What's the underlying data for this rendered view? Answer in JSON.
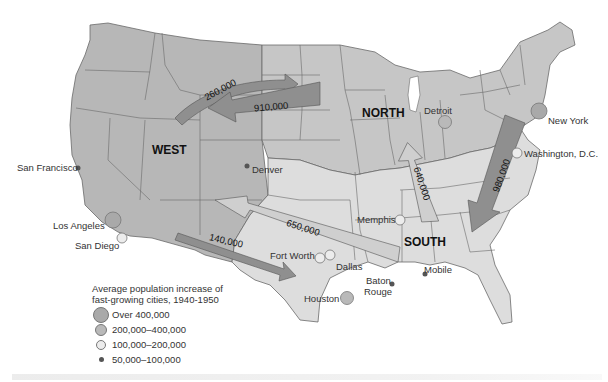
{
  "map": {
    "title": "Average population increase of fast-growing cities, 1940-1950",
    "colors": {
      "west": "#b7b7b7",
      "north": "#c6c6c6",
      "south": "#dddddd",
      "border": "#6a6a6a",
      "arrow_dark": "#8f8f8f",
      "arrow_light": "#cfcfcf",
      "circle_large": "#a9a9a9",
      "circle_medium": "#b9b9b9",
      "circle_small": "#ececec",
      "dot": "#555555"
    },
    "regions": [
      {
        "name": "WEST"
      },
      {
        "name": "NORTH"
      },
      {
        "name": "SOUTH"
      }
    ],
    "migration_arrows": [
      {
        "label": "260,000",
        "from": "WEST",
        "to": "NORTH"
      },
      {
        "label": "910,000",
        "from": "NORTH",
        "to": "WEST"
      },
      {
        "label": "140,000",
        "from": "WEST",
        "to": "SOUTH"
      },
      {
        "label": "650,000",
        "from": "SOUTH",
        "to": "WEST"
      },
      {
        "label": "640,000",
        "from": "SOUTH",
        "to": "NORTH"
      },
      {
        "label": "980,000",
        "from": "NORTH",
        "to": "SOUTH"
      }
    ],
    "cities": [
      {
        "name": "San Francisco",
        "category": "50,000–100,000"
      },
      {
        "name": "Los Angeles",
        "category": "Over 400,000"
      },
      {
        "name": "San Diego",
        "category": "100,000–200,000"
      },
      {
        "name": "Denver",
        "category": "50,000–100,000"
      },
      {
        "name": "Detroit",
        "category": "200,000–400,000"
      },
      {
        "name": "New York",
        "category": "Over 400,000"
      },
      {
        "name": "Washington, D.C.",
        "category": "100,000–200,000"
      },
      {
        "name": "Memphis",
        "category": "100,000–200,000"
      },
      {
        "name": "Fort Worth",
        "category": "100,000–200,000"
      },
      {
        "name": "Dallas",
        "category": "100,000–200,000"
      },
      {
        "name": "Houston",
        "category": "200,000–400,000"
      },
      {
        "name": "Baton Rouge",
        "category": "50,000–100,000"
      },
      {
        "name": "Mobile",
        "category": "50,000–100,000"
      }
    ]
  },
  "legend": {
    "title_line1": "Average population increase of",
    "title_line2": "fast-growing cities, 1940-1950",
    "items": [
      {
        "label": "Over 400,000",
        "symbol": "large-circle"
      },
      {
        "label": "200,000–400,000",
        "symbol": "medium-circle"
      },
      {
        "label": "100,000–200,000",
        "symbol": "small-circle"
      },
      {
        "label": "50,000–100,000",
        "symbol": "dot"
      }
    ]
  },
  "labels": {
    "west": "WEST",
    "north": "NORTH",
    "south": "SOUTH",
    "arrow_260": "260,000",
    "arrow_910": "910,000",
    "arrow_140": "140,000",
    "arrow_650": "650,000",
    "arrow_640": "640,000",
    "arrow_980": "980,000",
    "san_francisco": "San Francisco",
    "los_angeles": "Los Angeles",
    "san_diego": "San Diego",
    "denver": "Denver",
    "detroit": "Detroit",
    "new_york": "New York",
    "washington": "Washington, D.C.",
    "memphis": "Memphis",
    "fort_worth": "Fort Worth",
    "dallas": "Dallas",
    "houston": "Houston",
    "baton_rouge_1": "Baton",
    "baton_rouge_2": "Rouge",
    "mobile": "Mobile"
  }
}
